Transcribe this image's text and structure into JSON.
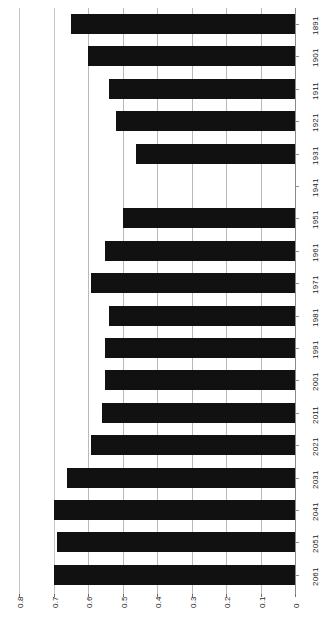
{
  "chart_data": {
    "type": "bar",
    "orientation": "horizontal",
    "title": "",
    "subtitle": "",
    "xlabel": "",
    "ylabel": "",
    "categories": [
      "1891",
      "1901",
      "1911",
      "1921",
      "1931",
      "1941",
      "1951",
      "1961",
      "1971",
      "1981",
      "1991",
      "2001",
      "2011",
      "2021",
      "2031",
      "2041",
      "2051",
      "2061"
    ],
    "values": [
      0.65,
      0.6,
      0.54,
      0.52,
      0.46,
      0.0,
      0.5,
      0.55,
      0.59,
      0.54,
      0.55,
      0.55,
      0.56,
      0.59,
      0.66,
      0.7,
      0.69,
      0.7
    ],
    "value_ticks": [
      "0",
      "0.1",
      "0.2",
      "0.3",
      "0.4",
      "0.5",
      "0.6",
      "0.7",
      "0.8"
    ],
    "value_tick_values": [
      0,
      0.1,
      0.2,
      0.3,
      0.4,
      0.5,
      0.6,
      0.7,
      0.8
    ],
    "xlim": [
      0,
      0.8
    ],
    "grid": true,
    "legend": null,
    "legend_position": "none",
    "bar_color": "#111111",
    "grid_color": "#b9b9b9",
    "background": "#ffffff"
  },
  "axes": {
    "category_axis_name": "year",
    "value_axis_name": "value"
  }
}
